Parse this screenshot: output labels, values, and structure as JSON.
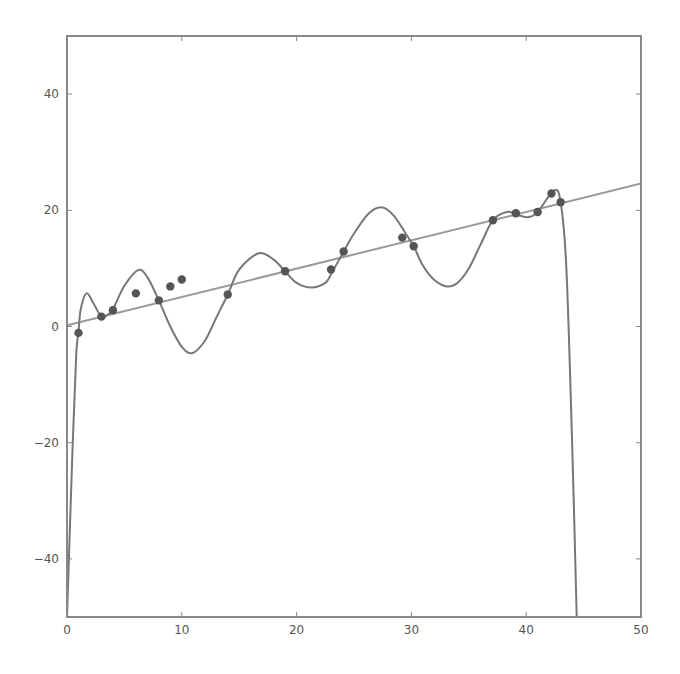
{
  "chart_data": {
    "type": "scatter",
    "title": "",
    "xlabel": "",
    "ylabel": "",
    "xlim": [
      0,
      50
    ],
    "ylim": [
      -50,
      50
    ],
    "grid": false,
    "legend": null,
    "x_ticks": [
      0,
      10,
      20,
      30,
      40,
      50
    ],
    "y_ticks": [
      -40,
      -20,
      0,
      20,
      40
    ],
    "x_tick_labels": [
      "0",
      "10",
      "20",
      "30",
      "40",
      "50"
    ],
    "y_tick_labels": [
      "−40",
      "−20",
      "0",
      "20",
      "40"
    ],
    "colors": {
      "points": "#555555",
      "linear_fit": "#999999",
      "poly_fit": "#777777",
      "frame": "#888888"
    },
    "series": [
      {
        "name": "data points",
        "kind": "scatter",
        "points": [
          [
            1.0,
            -1.1
          ],
          [
            3.0,
            1.7
          ],
          [
            4.0,
            2.8
          ],
          [
            6.0,
            5.7
          ],
          [
            8.0,
            4.5
          ],
          [
            9.0,
            6.9
          ],
          [
            10.0,
            8.1
          ],
          [
            14.0,
            5.5
          ],
          [
            19.0,
            9.5
          ],
          [
            23.0,
            9.8
          ],
          [
            24.1,
            12.9
          ],
          [
            29.2,
            15.3
          ],
          [
            30.2,
            13.8
          ],
          [
            37.1,
            18.3
          ],
          [
            39.1,
            19.5
          ],
          [
            41.0,
            19.7
          ],
          [
            42.2,
            22.9
          ],
          [
            43.0,
            21.4
          ]
        ]
      },
      {
        "name": "linear fit",
        "kind": "line",
        "points": [
          [
            0,
            0.2
          ],
          [
            50,
            24.6
          ]
        ]
      },
      {
        "name": "high-degree polynomial fit",
        "kind": "line",
        "points": [
          [
            0.0,
            -50
          ],
          [
            0.5,
            -20
          ],
          [
            0.8,
            -5
          ],
          [
            1.0,
            -1
          ],
          [
            1.2,
            3
          ],
          [
            1.7,
            5.7
          ],
          [
            2.3,
            4.0
          ],
          [
            3.0,
            1.7
          ],
          [
            3.5,
            2.0
          ],
          [
            4.0,
            3.0
          ],
          [
            5.0,
            7.0
          ],
          [
            6.2,
            9.7
          ],
          [
            7.0,
            8.5
          ],
          [
            8.0,
            4.5
          ],
          [
            9.0,
            0.0
          ],
          [
            10.0,
            -3.5
          ],
          [
            10.9,
            -4.6
          ],
          [
            12.0,
            -2.5
          ],
          [
            13.0,
            1.5
          ],
          [
            14.0,
            5.5
          ],
          [
            15.0,
            9.8
          ],
          [
            16.7,
            12.6
          ],
          [
            18.0,
            11.5
          ],
          [
            19.0,
            9.5
          ],
          [
            20.0,
            7.5
          ],
          [
            21.3,
            6.7
          ],
          [
            22.5,
            7.5
          ],
          [
            23.0,
            9.0
          ],
          [
            24.1,
            12.9
          ],
          [
            25.0,
            16.0
          ],
          [
            26.3,
            19.5
          ],
          [
            27.5,
            20.5
          ],
          [
            28.5,
            19.0
          ],
          [
            29.5,
            16.0
          ],
          [
            30.2,
            13.8
          ],
          [
            31.0,
            10.5
          ],
          [
            32.0,
            8.0
          ],
          [
            33.1,
            6.9
          ],
          [
            34.0,
            7.5
          ],
          [
            35.0,
            10.0
          ],
          [
            36.0,
            14.0
          ],
          [
            37.1,
            18.3
          ],
          [
            38.3,
            19.7
          ],
          [
            39.1,
            19.3
          ],
          [
            40.1,
            18.8
          ],
          [
            41.0,
            19.7
          ],
          [
            42.4,
            23.4
          ],
          [
            43.0,
            21.4
          ],
          [
            43.5,
            10.0
          ],
          [
            44.0,
            -20.0
          ],
          [
            44.4,
            -50.0
          ]
        ]
      }
    ]
  }
}
